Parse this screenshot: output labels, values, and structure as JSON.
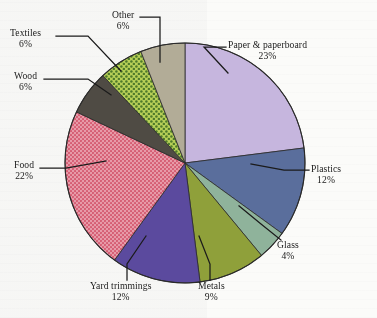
{
  "figure": {
    "type": "pie-chart",
    "caption": "",
    "background_color": "#fbfbf9",
    "outline_color": "#2a2a2a"
  },
  "chart_data": {
    "type": "pie",
    "title": "",
    "xlabel": "",
    "ylabel": "",
    "start_angle_deg": 0,
    "direction": "clockwise",
    "value_unit": "%",
    "total": 100,
    "legend": "none-labels-with-leader-lines",
    "categories": [
      "Paper & paperboard",
      "Plastics",
      "Glass",
      "Metals",
      "Yard trimmings",
      "Food",
      "Wood",
      "Textiles",
      "Other"
    ],
    "values": [
      23,
      12,
      4,
      9,
      12,
      22,
      6,
      6,
      6
    ],
    "labels": [
      "Paper & paperboard",
      "Plastics",
      "Glass",
      "Metals",
      "Yard trimmings",
      "Food",
      "Wood",
      "Textiles",
      "Other"
    ],
    "value_labels": [
      "23%",
      "12%",
      "4%",
      "9%",
      "12%",
      "22%",
      "6%",
      "6%",
      "6%"
    ],
    "colors": [
      "#c6b6de",
      "#5a6e9c",
      "#8fb39b",
      "#8fa03a",
      "#5b4a9e",
      "#e3899a",
      "#4f4b44",
      "#a9c34a",
      "#b2ac97"
    ],
    "patterns": [
      "solid",
      "solid",
      "solid",
      "solid",
      "solid",
      "dots",
      "solid",
      "dots",
      "solid"
    ],
    "slices": [
      {
        "label": "Paper & paperboard",
        "value": 23,
        "value_label": "23%",
        "color": "#c6b6de",
        "pattern": "solid"
      },
      {
        "label": "Plastics",
        "value": 12,
        "value_label": "12%",
        "color": "#5a6e9c",
        "pattern": "solid"
      },
      {
        "label": "Glass",
        "value": 4,
        "value_label": "4%",
        "color": "#8fb39b",
        "pattern": "solid"
      },
      {
        "label": "Metals",
        "value": 9,
        "value_label": "9%",
        "color": "#8fa03a",
        "pattern": "solid"
      },
      {
        "label": "Yard trimmings",
        "value": 12,
        "value_label": "12%",
        "color": "#5b4a9e",
        "pattern": "solid"
      },
      {
        "label": "Food",
        "value": 22,
        "value_label": "22%",
        "color": "#e3899a",
        "pattern": "dots"
      },
      {
        "label": "Wood",
        "value": 6,
        "value_label": "6%",
        "color": "#4f4b44",
        "pattern": "solid"
      },
      {
        "label": "Textiles",
        "value": 6,
        "value_label": "6%",
        "color": "#a9c34a",
        "pattern": "dots"
      },
      {
        "label": "Other",
        "value": 6,
        "value_label": "6%",
        "color": "#b2ac97",
        "pattern": "solid"
      }
    ]
  },
  "callouts": {
    "paper": {
      "name": "Paper & paperboard",
      "pct": "23%"
    },
    "plastics": {
      "name": "Plastics",
      "pct": "12%"
    },
    "glass": {
      "name": "Glass",
      "pct": "4%"
    },
    "metals": {
      "name": "Metals",
      "pct": "9%"
    },
    "yard": {
      "name": "Yard trimmings",
      "pct": "12%"
    },
    "food": {
      "name": "Food",
      "pct": "22%"
    },
    "wood": {
      "name": "Wood",
      "pct": "6%"
    },
    "textiles": {
      "name": "Textiles",
      "pct": "6%"
    },
    "other": {
      "name": "Other",
      "pct": "6%"
    }
  }
}
